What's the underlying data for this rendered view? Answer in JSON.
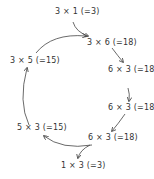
{
  "diagram": {
    "nodes": [
      {
        "id": "n1",
        "label": "3 × 1 (=3)"
      },
      {
        "id": "n2",
        "label": "3 × 6 (=18)"
      },
      {
        "id": "n3",
        "label": "6 × 3 (=18)"
      },
      {
        "id": "n4",
        "label": "6 × 3 (=18)"
      },
      {
        "id": "n5",
        "label": "6 × 3 (=18)"
      },
      {
        "id": "n6",
        "label": "1 × 3 (=3)"
      },
      {
        "id": "n7",
        "label": "5 × 3 (=15)"
      },
      {
        "id": "n8",
        "label": "3 × 5 (=15)"
      }
    ],
    "edges": [
      {
        "from": "n1",
        "to": "n2"
      },
      {
        "from": "n8",
        "to": "n2"
      },
      {
        "from": "n2",
        "to": "n3"
      },
      {
        "from": "n3",
        "to": "n4"
      },
      {
        "from": "n4",
        "to": "n5"
      },
      {
        "from": "n5",
        "to": "n6"
      },
      {
        "from": "n5",
        "to": "n7"
      },
      {
        "from": "n7",
        "to": "n8"
      }
    ],
    "stroke_color": "#444444"
  }
}
